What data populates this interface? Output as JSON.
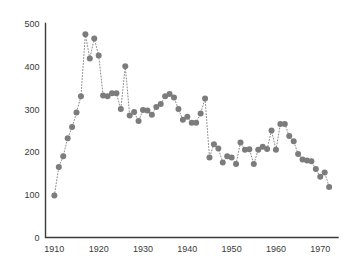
{
  "chart_data": {
    "type": "scatter",
    "title": "",
    "subtitle": "",
    "xlabel": "",
    "ylabel": "",
    "xlim": [
      1908,
      1974
    ],
    "ylim": [
      0,
      500
    ],
    "grid": false,
    "legend": null,
    "marker_color": "#7c7c7c",
    "connector_style": "dotted",
    "xticks": [
      1910,
      1920,
      1930,
      1940,
      1950,
      1960,
      1970
    ],
    "xtick_labels": [
      "1910",
      "1920",
      "1930",
      "1940",
      "1950",
      "1960",
      "1970"
    ],
    "yticks": [
      0,
      100,
      200,
      300,
      400,
      500
    ],
    "ytick_labels": [
      "0",
      "100",
      "200",
      "300",
      "400",
      "500"
    ],
    "series": [
      {
        "name": "series-1",
        "x": [
          1910,
          1911,
          1912,
          1913,
          1914,
          1915,
          1916,
          1917,
          1918,
          1919,
          1920,
          1921,
          1922,
          1923,
          1924,
          1925,
          1926,
          1927,
          1928,
          1929,
          1930,
          1931,
          1932,
          1933,
          1934,
          1935,
          1936,
          1937,
          1938,
          1939,
          1940,
          1941,
          1942,
          1943,
          1944,
          1945,
          1946,
          1947,
          1948,
          1949,
          1950,
          1951,
          1952,
          1953,
          1954,
          1955,
          1956,
          1957,
          1958,
          1959,
          1960,
          1961,
          1962,
          1963,
          1964,
          1965,
          1966,
          1967,
          1968,
          1969,
          1970,
          1971,
          1972
        ],
        "y": [
          98,
          165,
          190,
          232,
          258,
          292,
          330,
          475,
          418,
          465,
          425,
          332,
          330,
          337,
          337,
          300,
          400,
          285,
          293,
          272,
          298,
          297,
          287,
          305,
          312,
          330,
          335,
          327,
          300,
          275,
          282,
          268,
          268,
          290,
          325,
          187,
          218,
          208,
          175,
          190,
          187,
          172,
          222,
          205,
          206,
          172,
          205,
          212,
          207,
          250,
          205,
          265,
          265,
          237,
          225,
          195,
          182,
          180,
          178,
          160,
          142,
          152,
          118
        ]
      }
    ]
  },
  "axes": {
    "y_axis_name": "value-axis",
    "x_axis_name": "year-axis"
  }
}
